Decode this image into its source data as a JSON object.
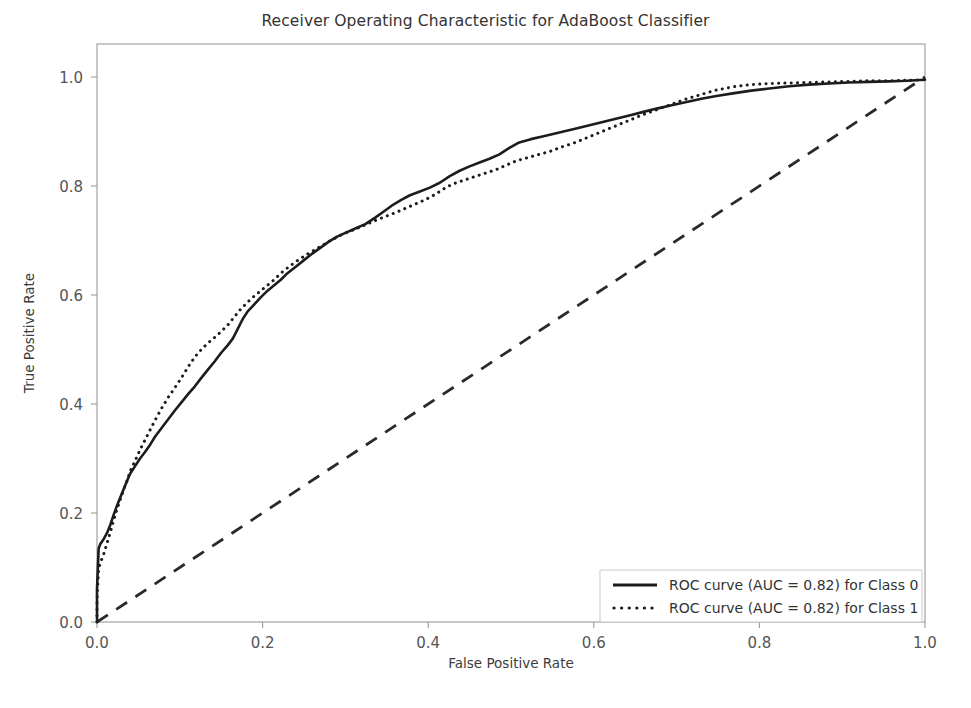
{
  "chart_data": {
    "type": "line",
    "title": "Receiver Operating Characteristic for AdaBoost Classifier",
    "xlabel": "False Positive Rate",
    "ylabel": "True Positive Rate",
    "xlim": [
      0.0,
      1.0
    ],
    "ylim": [
      0.0,
      1.0
    ],
    "xticks": [
      "0.0",
      "0.2",
      "0.4",
      "0.6",
      "0.8",
      "1.0"
    ],
    "yticks": [
      "0.0",
      "0.2",
      "0.4",
      "0.6",
      "0.8",
      "1.0"
    ],
    "xtick_values": [
      0.0,
      0.2,
      0.4,
      0.6,
      0.8,
      1.0
    ],
    "ytick_values": [
      0.0,
      0.2,
      0.4,
      0.6,
      0.8,
      1.0
    ],
    "grid": false,
    "legend_position": "lower right",
    "legend": [
      "ROC curve (AUC = 0.82) for Class 0",
      "ROC curve (AUC = 0.82) for Class 1"
    ],
    "series": [
      {
        "name": "ROC curve (AUC = 0.82) for Class 0",
        "auc": 0.82,
        "style": "solid",
        "color": "#1c1c1c",
        "points": [
          [
            0.0,
            0.0
          ],
          [
            0.0,
            0.06
          ],
          [
            0.002,
            0.135
          ],
          [
            0.004,
            0.143
          ],
          [
            0.008,
            0.152
          ],
          [
            0.012,
            0.163
          ],
          [
            0.016,
            0.178
          ],
          [
            0.02,
            0.196
          ],
          [
            0.024,
            0.213
          ],
          [
            0.028,
            0.228
          ],
          [
            0.032,
            0.243
          ],
          [
            0.036,
            0.258
          ],
          [
            0.04,
            0.272
          ],
          [
            0.046,
            0.286
          ],
          [
            0.052,
            0.3
          ],
          [
            0.058,
            0.312
          ],
          [
            0.064,
            0.325
          ],
          [
            0.07,
            0.34
          ],
          [
            0.078,
            0.356
          ],
          [
            0.086,
            0.372
          ],
          [
            0.094,
            0.388
          ],
          [
            0.102,
            0.403
          ],
          [
            0.11,
            0.418
          ],
          [
            0.118,
            0.432
          ],
          [
            0.126,
            0.448
          ],
          [
            0.134,
            0.463
          ],
          [
            0.142,
            0.478
          ],
          [
            0.15,
            0.494
          ],
          [
            0.158,
            0.508
          ],
          [
            0.164,
            0.52
          ],
          [
            0.17,
            0.538
          ],
          [
            0.176,
            0.556
          ],
          [
            0.182,
            0.57
          ],
          [
            0.19,
            0.583
          ],
          [
            0.198,
            0.596
          ],
          [
            0.206,
            0.608
          ],
          [
            0.214,
            0.618
          ],
          [
            0.222,
            0.628
          ],
          [
            0.23,
            0.64
          ],
          [
            0.24,
            0.652
          ],
          [
            0.25,
            0.664
          ],
          [
            0.26,
            0.676
          ],
          [
            0.27,
            0.687
          ],
          [
            0.28,
            0.698
          ],
          [
            0.29,
            0.707
          ],
          [
            0.3,
            0.714
          ],
          [
            0.312,
            0.722
          ],
          [
            0.324,
            0.73
          ],
          [
            0.336,
            0.742
          ],
          [
            0.348,
            0.755
          ],
          [
            0.358,
            0.766
          ],
          [
            0.368,
            0.775
          ],
          [
            0.378,
            0.783
          ],
          [
            0.39,
            0.79
          ],
          [
            0.402,
            0.797
          ],
          [
            0.414,
            0.806
          ],
          [
            0.426,
            0.818
          ],
          [
            0.438,
            0.828
          ],
          [
            0.45,
            0.836
          ],
          [
            0.462,
            0.843
          ],
          [
            0.474,
            0.85
          ],
          [
            0.486,
            0.858
          ],
          [
            0.498,
            0.87
          ],
          [
            0.51,
            0.88
          ],
          [
            0.524,
            0.886
          ],
          [
            0.538,
            0.891
          ],
          [
            0.552,
            0.896
          ],
          [
            0.566,
            0.901
          ],
          [
            0.58,
            0.906
          ],
          [
            0.596,
            0.912
          ],
          [
            0.612,
            0.918
          ],
          [
            0.628,
            0.924
          ],
          [
            0.644,
            0.93
          ],
          [
            0.66,
            0.936
          ],
          [
            0.676,
            0.942
          ],
          [
            0.694,
            0.948
          ],
          [
            0.712,
            0.954
          ],
          [
            0.73,
            0.96
          ],
          [
            0.748,
            0.965
          ],
          [
            0.768,
            0.97
          ],
          [
            0.79,
            0.975
          ],
          [
            0.812,
            0.979
          ],
          [
            0.836,
            0.983
          ],
          [
            0.86,
            0.986
          ],
          [
            0.884,
            0.988
          ],
          [
            0.908,
            0.99
          ],
          [
            0.932,
            0.991
          ],
          [
            0.956,
            0.992
          ],
          [
            0.978,
            0.993
          ],
          [
            1.0,
            0.995
          ]
        ]
      },
      {
        "name": "ROC curve (AUC = 0.82) for Class 1",
        "auc": 0.82,
        "style": "dotted",
        "color": "#1c1c1c",
        "points": [
          [
            0.0,
            0.0
          ],
          [
            0.0,
            0.04
          ],
          [
            0.002,
            0.098
          ],
          [
            0.004,
            0.108
          ],
          [
            0.008,
            0.124
          ],
          [
            0.012,
            0.144
          ],
          [
            0.016,
            0.164
          ],
          [
            0.02,
            0.186
          ],
          [
            0.024,
            0.206
          ],
          [
            0.028,
            0.224
          ],
          [
            0.032,
            0.242
          ],
          [
            0.036,
            0.258
          ],
          [
            0.04,
            0.276
          ],
          [
            0.046,
            0.296
          ],
          [
            0.052,
            0.316
          ],
          [
            0.058,
            0.334
          ],
          [
            0.064,
            0.352
          ],
          [
            0.07,
            0.37
          ],
          [
            0.078,
            0.392
          ],
          [
            0.086,
            0.412
          ],
          [
            0.094,
            0.43
          ],
          [
            0.102,
            0.448
          ],
          [
            0.11,
            0.468
          ],
          [
            0.118,
            0.486
          ],
          [
            0.126,
            0.5
          ],
          [
            0.134,
            0.512
          ],
          [
            0.142,
            0.522
          ],
          [
            0.15,
            0.533
          ],
          [
            0.158,
            0.545
          ],
          [
            0.166,
            0.56
          ],
          [
            0.174,
            0.575
          ],
          [
            0.182,
            0.587
          ],
          [
            0.19,
            0.598
          ],
          [
            0.198,
            0.608
          ],
          [
            0.206,
            0.618
          ],
          [
            0.214,
            0.628
          ],
          [
            0.222,
            0.64
          ],
          [
            0.232,
            0.652
          ],
          [
            0.242,
            0.663
          ],
          [
            0.252,
            0.673
          ],
          [
            0.262,
            0.682
          ],
          [
            0.272,
            0.691
          ],
          [
            0.282,
            0.7
          ],
          [
            0.292,
            0.708
          ],
          [
            0.302,
            0.715
          ],
          [
            0.314,
            0.722
          ],
          [
            0.326,
            0.73
          ],
          [
            0.338,
            0.738
          ],
          [
            0.35,
            0.745
          ],
          [
            0.362,
            0.752
          ],
          [
            0.374,
            0.76
          ],
          [
            0.386,
            0.768
          ],
          [
            0.398,
            0.776
          ],
          [
            0.41,
            0.786
          ],
          [
            0.422,
            0.798
          ],
          [
            0.434,
            0.806
          ],
          [
            0.446,
            0.812
          ],
          [
            0.458,
            0.818
          ],
          [
            0.47,
            0.824
          ],
          [
            0.482,
            0.83
          ],
          [
            0.494,
            0.838
          ],
          [
            0.506,
            0.846
          ],
          [
            0.52,
            0.852
          ],
          [
            0.534,
            0.858
          ],
          [
            0.548,
            0.864
          ],
          [
            0.562,
            0.872
          ],
          [
            0.578,
            0.88
          ],
          [
            0.594,
            0.89
          ],
          [
            0.61,
            0.9
          ],
          [
            0.626,
            0.91
          ],
          [
            0.642,
            0.92
          ],
          [
            0.658,
            0.93
          ],
          [
            0.676,
            0.94
          ],
          [
            0.694,
            0.95
          ],
          [
            0.712,
            0.96
          ],
          [
            0.73,
            0.968
          ],
          [
            0.748,
            0.976
          ],
          [
            0.768,
            0.982
          ],
          [
            0.79,
            0.986
          ],
          [
            0.812,
            0.988
          ],
          [
            0.836,
            0.989
          ],
          [
            0.86,
            0.99
          ],
          [
            0.884,
            0.991
          ],
          [
            0.908,
            0.992
          ],
          [
            0.932,
            0.993
          ],
          [
            0.956,
            0.993
          ],
          [
            0.978,
            0.994
          ],
          [
            1.0,
            0.995
          ]
        ]
      },
      {
        "name": "chance-diagonal",
        "style": "dashed",
        "color": "#2a2a2a",
        "points": [
          [
            0.0,
            0.0
          ],
          [
            1.0,
            1.0
          ]
        ]
      }
    ]
  }
}
